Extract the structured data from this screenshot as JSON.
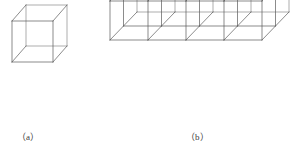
{
  "figure": {
    "kind": "technical-line-drawing",
    "background_color": "#ffffff",
    "line_color": "#5a5a5a",
    "line_color_light": "#8a8a8a",
    "line_width": 0.7,
    "projection": "oblique (cavalier)",
    "captions": {
      "a": "（a）",
      "b": "（b）"
    },
    "panels": [
      {
        "id": "a",
        "name": "single-unit-cube",
        "caption": "（a）",
        "description": "One wireframe unit cube",
        "cells": {
          "nx": 1,
          "ny": 1,
          "nz": 1
        },
        "origin": {
          "x": 12,
          "y": 62
        },
        "cell_width": 41,
        "cell_height": 41,
        "depth_dx": 14,
        "depth_dy": -16
      },
      {
        "id": "b",
        "name": "subdivided-grid-block",
        "caption": "（b）",
        "description": "Wireframe block subdivided into a 4 x 2 x 2 grid of unit cubes",
        "cells": {
          "nx": 4,
          "ny": 2,
          "nz": 2
        },
        "origin": {
          "x": 110,
          "y": 40
        },
        "cell_width": 38,
        "cell_height": 39,
        "depth_dx": 13.5,
        "depth_dy": -14
      }
    ]
  }
}
